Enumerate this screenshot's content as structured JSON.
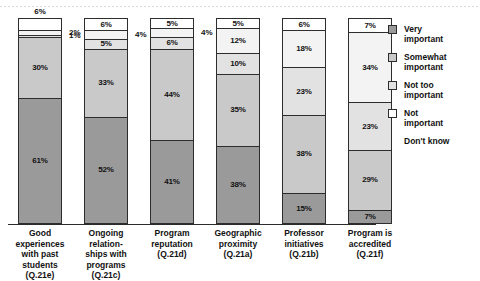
{
  "chart_data": {
    "type": "bar",
    "stacked": true,
    "orientation": "vertical",
    "normalized_percent": true,
    "title": "",
    "subtitle": "",
    "xlabel": "",
    "ylabel": "",
    "ylim": [
      0,
      100
    ],
    "grid": false,
    "legend_position": "right",
    "value_suffix": "%",
    "categories": [
      "Good experiences with past students (Q.21e)",
      "Ongoing relation-ships with programs (Q.21c)",
      "Program reputation (Q.21d)",
      "Geographic proximity (Q.21a)",
      "Professor initiatives (Q.21b)",
      "Program is accredited (Q.21f)"
    ],
    "series": [
      {
        "name": "Very important",
        "values": [
          61,
          52,
          41,
          38,
          15,
          7
        ]
      },
      {
        "name": "Somewhat important",
        "values": [
          30,
          33,
          44,
          35,
          38,
          29
        ]
      },
      {
        "name": "Not too important",
        "values": [
          1,
          5,
          6,
          10,
          23,
          23
        ]
      },
      {
        "name": "Not important",
        "values": [
          2,
          4,
          4,
          12,
          18,
          34
        ]
      },
      {
        "name": "Don't know",
        "values": [
          6,
          6,
          5,
          5,
          6,
          7
        ]
      }
    ]
  },
  "chart": {
    "bars": [
      {
        "key": "good-experiences",
        "label_lines": [
          "Good",
          "experiences",
          "with past",
          "students",
          "(Q.21e)"
        ],
        "segments": [
          {
            "series": "Very important",
            "label": "61%",
            "pct": 61,
            "placement": "inside"
          },
          {
            "series": "Somewhat important",
            "label": "30%",
            "pct": 30,
            "placement": "inside"
          },
          {
            "series": "Not too important",
            "label": "1%",
            "pct": 1,
            "placement": "outside-right"
          },
          {
            "series": "Not important",
            "label": "2%",
            "pct": 2,
            "placement": "outside-right"
          },
          {
            "series": "Don't know",
            "label": "6%",
            "pct": 6,
            "placement": "outside-top"
          }
        ]
      },
      {
        "key": "ongoing-relationships",
        "label_lines": [
          "Ongoing",
          "relation-",
          "ships with",
          "programs",
          "(Q.21c)"
        ],
        "segments": [
          {
            "series": "Very important",
            "label": "52%",
            "pct": 52,
            "placement": "inside"
          },
          {
            "series": "Somewhat important",
            "label": "33%",
            "pct": 33,
            "placement": "inside"
          },
          {
            "series": "Not too important",
            "label": "5%",
            "pct": 5,
            "placement": "inside"
          },
          {
            "series": "Not important",
            "label": "4%",
            "pct": 4,
            "placement": "outside-right"
          },
          {
            "series": "Don't know",
            "label": "6%",
            "pct": 6,
            "placement": "inside"
          }
        ]
      },
      {
        "key": "program-reputation",
        "label_lines": [
          "Program",
          "reputation",
          "(Q.21d)"
        ],
        "segments": [
          {
            "series": "Very important",
            "label": "41%",
            "pct": 41,
            "placement": "inside"
          },
          {
            "series": "Somewhat important",
            "label": "44%",
            "pct": 44,
            "placement": "inside"
          },
          {
            "series": "Not too important",
            "label": "6%",
            "pct": 6,
            "placement": "inside"
          },
          {
            "series": "Not important",
            "label": "4%",
            "pct": 4,
            "placement": "outside-right"
          },
          {
            "series": "Don't know",
            "label": "5%",
            "pct": 5,
            "placement": "inside"
          }
        ]
      },
      {
        "key": "geographic-proximity",
        "label_lines": [
          "Geographic",
          "proximity",
          "(Q.21a)"
        ],
        "segments": [
          {
            "series": "Very important",
            "label": "38%",
            "pct": 38,
            "placement": "inside"
          },
          {
            "series": "Somewhat important",
            "label": "35%",
            "pct": 35,
            "placement": "inside"
          },
          {
            "series": "Not too important",
            "label": "10%",
            "pct": 10,
            "placement": "inside"
          },
          {
            "series": "Not important",
            "label": "12%",
            "pct": 12,
            "placement": "inside"
          },
          {
            "series": "Don't know",
            "label": "5%",
            "pct": 5,
            "placement": "inside"
          }
        ]
      },
      {
        "key": "professor-initiatives",
        "label_lines": [
          "Professor",
          "initiatives",
          "(Q.21b)"
        ],
        "segments": [
          {
            "series": "Very important",
            "label": "15%",
            "pct": 15,
            "placement": "inside"
          },
          {
            "series": "Somewhat important",
            "label": "38%",
            "pct": 38,
            "placement": "inside"
          },
          {
            "series": "Not too important",
            "label": "23%",
            "pct": 23,
            "placement": "inside"
          },
          {
            "series": "Not important",
            "label": "18%",
            "pct": 18,
            "placement": "inside"
          },
          {
            "series": "Don't know",
            "label": "6%",
            "pct": 6,
            "placement": "inside"
          }
        ]
      },
      {
        "key": "program-accredited",
        "label_lines": [
          "Program is",
          "accredited",
          "(Q.21f)"
        ],
        "segments": [
          {
            "series": "Very important",
            "label": "7%",
            "pct": 7,
            "placement": "inside"
          },
          {
            "series": "Somewhat important",
            "label": "29%",
            "pct": 29,
            "placement": "inside"
          },
          {
            "series": "Not too important",
            "label": "23%",
            "pct": 23,
            "placement": "inside"
          },
          {
            "series": "Not important",
            "label": "34%",
            "pct": 34,
            "placement": "inside"
          },
          {
            "series": "Don't know",
            "label": "7%",
            "pct": 7,
            "placement": "inside"
          }
        ]
      }
    ]
  },
  "legend": {
    "items": [
      {
        "label_lines": [
          "Very",
          "important"
        ],
        "color": "#9a9a9a",
        "has_swatch": true
      },
      {
        "label_lines": [
          "Somewhat",
          "important"
        ],
        "color": "#c9c9c9",
        "has_swatch": true
      },
      {
        "label_lines": [
          "Not too",
          "important"
        ],
        "color": "#e2e2e2",
        "has_swatch": true
      },
      {
        "label_lines": [
          "Not",
          "important"
        ],
        "color": "#ffffff",
        "has_swatch": true
      },
      {
        "label_lines": [
          "Don't know"
        ],
        "color": "",
        "has_swatch": false
      }
    ]
  },
  "colors": {
    "very_important": "#9a9a9a",
    "somewhat_important": "#c9c9c9",
    "not_too_important": "#e2e2e2",
    "not_important": "#f3f3f3",
    "dont_know": "#ffffff",
    "outline": "#2d2d2d",
    "text": "#111111",
    "background": "#ffffff"
  }
}
